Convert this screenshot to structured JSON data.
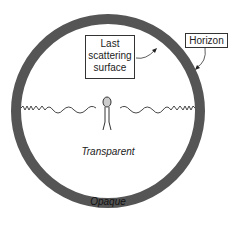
{
  "diagram": {
    "labels": {
      "last_scattering": "Last scattering surface",
      "last_scattering_lines": [
        "Last",
        "scattering",
        "surface"
      ],
      "horizon": "Horizon",
      "transparent": "Transparent",
      "opaque": "Opaque"
    },
    "colors": {
      "ring": "#555555",
      "ring_text": "#111111",
      "line": "#333333"
    },
    "elements": [
      "observer-figure",
      "photon-wave-left",
      "photon-wave-right"
    ]
  }
}
